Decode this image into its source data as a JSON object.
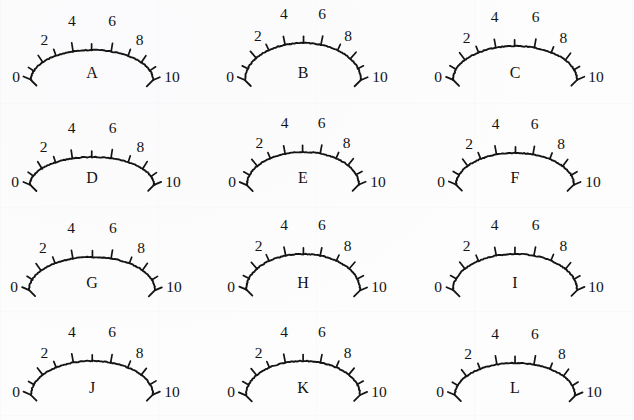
{
  "figure": {
    "rows": 4,
    "columns": 3,
    "tick_labels": [
      "0",
      "2",
      "4",
      "6",
      "8",
      "10"
    ],
    "scale_min": 0,
    "scale_max": 10,
    "minor_ticks": [
      1,
      2,
      3,
      4,
      5,
      6,
      7,
      8,
      9
    ],
    "ink_color": "#141414",
    "paper_color": "#fdfdfd"
  },
  "chart_data": {
    "type": "scatter",
    "xlabel": "",
    "ylabel": "",
    "series": [
      {
        "name": "gauge arc geometry",
        "values": [
          {
            "id": "A",
            "row": 1,
            "col": 1,
            "arc_half_width": 61,
            "arc_height": 30
          },
          {
            "id": "B",
            "row": 1,
            "col": 2,
            "arc_half_width": 58,
            "arc_height": 37
          },
          {
            "id": "C",
            "row": 1,
            "col": 3,
            "arc_half_width": 62,
            "arc_height": 34
          },
          {
            "id": "D",
            "row": 2,
            "col": 1,
            "arc_half_width": 62,
            "arc_height": 28
          },
          {
            "id": "E",
            "row": 2,
            "col": 2,
            "arc_half_width": 56,
            "arc_height": 33
          },
          {
            "id": "F",
            "row": 2,
            "col": 3,
            "arc_half_width": 59,
            "arc_height": 32
          },
          {
            "id": "G",
            "row": 3,
            "col": 1,
            "arc_half_width": 63,
            "arc_height": 33
          },
          {
            "id": "H",
            "row": 3,
            "col": 2,
            "arc_half_width": 57,
            "arc_height": 36
          },
          {
            "id": "I",
            "row": 3,
            "col": 3,
            "arc_half_width": 62,
            "arc_height": 36
          },
          {
            "id": "J",
            "row": 4,
            "col": 1,
            "arc_half_width": 61,
            "arc_height": 34
          },
          {
            "id": "K",
            "row": 4,
            "col": 2,
            "arc_half_width": 57,
            "arc_height": 34
          },
          {
            "id": "L",
            "row": 4,
            "col": 3,
            "arc_half_width": 60,
            "arc_height": 32
          }
        ]
      }
    ],
    "legend": "none",
    "grid": false
  },
  "gauges": [
    {
      "letter": "A",
      "labels": {
        "v0": "0",
        "v2": "2",
        "v4": "4",
        "v6": "6",
        "v8": "8",
        "v10": "10"
      }
    },
    {
      "letter": "B",
      "labels": {
        "v0": "0",
        "v2": "2",
        "v4": "4",
        "v6": "6",
        "v8": "8",
        "v10": "10"
      }
    },
    {
      "letter": "C",
      "labels": {
        "v0": "0",
        "v2": "2",
        "v4": "4",
        "v6": "6",
        "v8": "8",
        "v10": "10"
      }
    },
    {
      "letter": "D",
      "labels": {
        "v0": "0",
        "v2": "2",
        "v4": "4",
        "v6": "6",
        "v8": "8",
        "v10": "10"
      }
    },
    {
      "letter": "E",
      "labels": {
        "v0": "0",
        "v2": "2",
        "v4": "4",
        "v6": "6",
        "v8": "8",
        "v10": "10"
      }
    },
    {
      "letter": "F",
      "labels": {
        "v0": "0",
        "v2": "2",
        "v4": "4",
        "v6": "6",
        "v8": "8",
        "v10": "10"
      }
    },
    {
      "letter": "G",
      "labels": {
        "v0": "0",
        "v2": "2",
        "v4": "4",
        "v6": "6",
        "v8": "8",
        "v10": "10"
      }
    },
    {
      "letter": "H",
      "labels": {
        "v0": "0",
        "v2": "2",
        "v4": "4",
        "v6": "6",
        "v8": "8",
        "v10": "10"
      }
    },
    {
      "letter": "I",
      "labels": {
        "v0": "0",
        "v2": "2",
        "v4": "4",
        "v6": "6",
        "v8": "8",
        "v10": "10"
      }
    },
    {
      "letter": "J",
      "labels": {
        "v0": "0",
        "v2": "2",
        "v4": "4",
        "v6": "6",
        "v8": "8",
        "v10": "10"
      }
    },
    {
      "letter": "K",
      "labels": {
        "v0": "0",
        "v2": "2",
        "v4": "4",
        "v6": "6",
        "v8": "8",
        "v10": "10"
      }
    },
    {
      "letter": "L",
      "labels": {
        "v0": "0",
        "v2": "2",
        "v4": "4",
        "v6": "6",
        "v8": "8",
        "v10": "10"
      }
    }
  ]
}
